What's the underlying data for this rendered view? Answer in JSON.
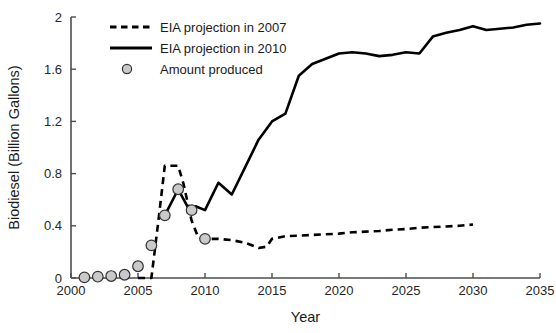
{
  "chart_data": {
    "type": "line",
    "title": "",
    "xlabel": "Year",
    "ylabel": "Biodiesel (Billion Gallons)",
    "xlim": [
      2000,
      2035
    ],
    "ylim": [
      0,
      2
    ],
    "xticks": [
      2000,
      2005,
      2010,
      2015,
      2020,
      2025,
      2030,
      2035
    ],
    "xtick_labels": [
      "2000",
      "2005",
      "2010",
      "2015",
      "2020",
      "2025",
      "2030",
      "2035"
    ],
    "yticks": [
      0,
      0.4,
      0.8,
      1.2,
      1.6,
      2
    ],
    "ytick_labels": [
      "0",
      "0.4",
      "0.8",
      "1.2",
      "1.6",
      "2"
    ],
    "grid": false,
    "legend_position": "upper-left-inside",
    "series": [
      {
        "name": "EIA projection in 2007",
        "style": "dashed",
        "color": "#000000",
        "x": [
          2005,
          2006,
          2006.5,
          2007,
          2007.6,
          2008,
          2008.4,
          2009,
          2009.5,
          2010,
          2011,
          2012,
          2013,
          2014,
          2014.6,
          2015,
          2016,
          2017,
          2018,
          2019,
          2020,
          2021,
          2022,
          2023,
          2024,
          2025,
          2026,
          2027,
          2028,
          2029,
          2030
        ],
        "y": [
          0.0,
          0.0,
          0.42,
          0.86,
          0.86,
          0.86,
          0.72,
          0.44,
          0.31,
          0.3,
          0.3,
          0.29,
          0.27,
          0.23,
          0.24,
          0.3,
          0.32,
          0.325,
          0.33,
          0.335,
          0.34,
          0.35,
          0.355,
          0.36,
          0.37,
          0.375,
          0.385,
          0.39,
          0.395,
          0.4,
          0.41
        ]
      },
      {
        "name": "EIA projection in 2010",
        "style": "solid",
        "color": "#000000",
        "x": [
          2007,
          2008,
          2009,
          2009.3,
          2010,
          2011,
          2012,
          2013,
          2014,
          2015,
          2016,
          2017,
          2018,
          2019,
          2020,
          2021,
          2022,
          2023,
          2024,
          2025,
          2026,
          2027,
          2028,
          2029,
          2030,
          2031,
          2032,
          2033,
          2034,
          2035
        ],
        "y": [
          0.48,
          0.68,
          0.49,
          0.55,
          0.52,
          0.73,
          0.64,
          0.85,
          1.06,
          1.2,
          1.26,
          1.55,
          1.64,
          1.68,
          1.72,
          1.73,
          1.72,
          1.7,
          1.71,
          1.73,
          1.72,
          1.85,
          1.88,
          1.9,
          1.93,
          1.9,
          1.91,
          1.92,
          1.94,
          1.95
        ]
      },
      {
        "name": "Amount produced",
        "style": "markers",
        "color": "#c9c9c9",
        "x": [
          2001,
          2002,
          2003,
          2004,
          2005,
          2006,
          2007,
          2008,
          2009,
          2010
        ],
        "y": [
          0.005,
          0.01,
          0.015,
          0.025,
          0.09,
          0.25,
          0.48,
          0.68,
          0.52,
          0.3
        ]
      }
    ],
    "legend_entries": [
      {
        "label": "EIA projection in 2007",
        "style": "dashed"
      },
      {
        "label": "EIA projection in 2010",
        "style": "solid"
      },
      {
        "label": "Amount produced",
        "style": "marker"
      }
    ]
  }
}
